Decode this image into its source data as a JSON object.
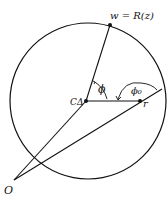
{
  "diagram": {
    "type": "geometry",
    "circle": {
      "cx": 88,
      "cy": 101,
      "r": 78
    },
    "points": {
      "center": {
        "label": "CΔ",
        "x": 86,
        "y": 101
      },
      "w": {
        "label": "w = R(z)",
        "x": 110,
        "y": 25
      },
      "r": {
        "label": "r",
        "x": 140,
        "y": 101
      },
      "origin": {
        "label": "O",
        "x": 14,
        "y": 180
      }
    },
    "angles": {
      "phi": {
        "label": "ϕ"
      },
      "phi0": {
        "label": "ϕ₀"
      }
    },
    "colors": {
      "stroke": "#111111",
      "background": "#ffffff"
    }
  }
}
